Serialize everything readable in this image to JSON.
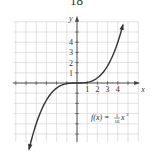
{
  "page_number": "18",
  "chart_data": {
    "type": "line",
    "title": "",
    "function_label": "f(x) = (1/16)x^3",
    "function_label_parts": {
      "lhs": "f(x) = ",
      "num": "1",
      "den": "16",
      "var": "x",
      "exp": "3"
    },
    "xlabel": "x",
    "ylabel": "y",
    "x_ticks": [
      "1",
      "2",
      "3",
      "4"
    ],
    "y_ticks": [
      "1",
      "2",
      "3",
      "4"
    ],
    "xlim": [
      -6,
      6
    ],
    "ylim": [
      -6,
      6
    ],
    "grid": true,
    "curve_domain": [
      -4.7,
      4.5
    ],
    "series": [
      {
        "name": "f(x)",
        "expression": "x^3/16",
        "arrows": "both"
      }
    ],
    "colors": {
      "grid": "#cfcfcf",
      "axis": "#444444",
      "curve": "#333333"
    }
  }
}
